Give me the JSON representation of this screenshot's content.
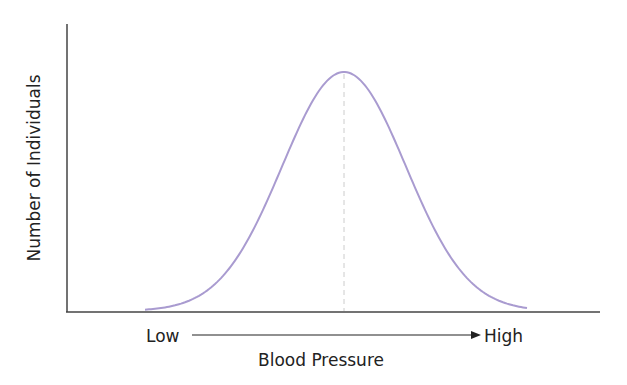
{
  "chart_data": {
    "type": "line",
    "title": "",
    "xlabel": "Blood Pressure",
    "ylabel": "Number of Individuals",
    "x_axis_annotations": {
      "low": "Low",
      "high": "High",
      "arrow": "low-to-high"
    },
    "series": [
      {
        "name": "distribution",
        "color": "#a99bd0",
        "x": [
          -3,
          -2.5,
          -2,
          -1.5,
          -1,
          -0.5,
          0,
          0.5,
          1,
          1.5,
          2,
          2.5,
          3
        ],
        "values": [
          0.011,
          0.044,
          0.135,
          0.325,
          0.607,
          0.882,
          1.0,
          0.882,
          0.607,
          0.325,
          0.135,
          0.044,
          0.011
        ]
      }
    ],
    "mean_marker": {
      "x": 0,
      "style": "dashed",
      "color": "#cccccc"
    },
    "grid": false,
    "ticks": false,
    "legend": null
  },
  "labels": {
    "ylabel": "Number of Individuals",
    "xlabel": "Blood Pressure",
    "low": "Low",
    "high": "High"
  },
  "colors": {
    "curve": "#a99bd0",
    "axis": "#444444",
    "mean_line": "#cccccc"
  }
}
